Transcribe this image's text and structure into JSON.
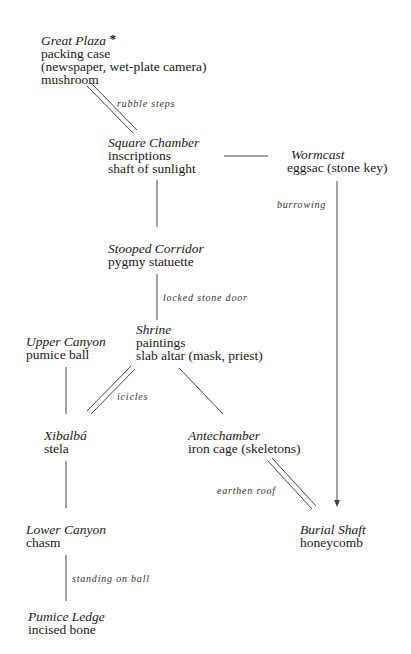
{
  "diagram": {
    "type": "map",
    "nodes": [
      {
        "id": "great-plaza",
        "title": "Great Plaza",
        "marker": "*",
        "items": [
          "packing case",
          "(newspaper, wet-plate camera)",
          "mushroom"
        ]
      },
      {
        "id": "square-chamber",
        "title": "Square Chamber",
        "items": [
          "inscriptions",
          "shaft of sunlight"
        ]
      },
      {
        "id": "wormcast",
        "title": "Wormcast",
        "items": [
          "eggsac (stone key)"
        ]
      },
      {
        "id": "stooped-corridor",
        "title": "Stooped Corridor",
        "items": [
          "pygmy statuette"
        ]
      },
      {
        "id": "shrine",
        "title": "Shrine",
        "items": [
          "paintings",
          "slab altar (mask, priest)"
        ]
      },
      {
        "id": "upper-canyon",
        "title": "Upper Canyon",
        "items": [
          "pumice ball"
        ]
      },
      {
        "id": "xibalba",
        "title": "Xibalbá",
        "items": [
          "stela"
        ]
      },
      {
        "id": "antechamber",
        "title": "Antechamber",
        "items": [
          "iron cage (skeletons)"
        ]
      },
      {
        "id": "lower-canyon",
        "title": "Lower Canyon",
        "items": [
          "chasm"
        ]
      },
      {
        "id": "burial-shaft",
        "title": "Burial Shaft",
        "items": [
          "honeycomb"
        ]
      },
      {
        "id": "pumice-ledge",
        "title": "Pumice Ledge",
        "items": [
          "incised bone"
        ]
      }
    ],
    "edges": [
      {
        "from": "great-plaza",
        "to": "square-chamber",
        "style": "double",
        "label": "rubble steps"
      },
      {
        "from": "square-chamber",
        "to": "wormcast",
        "style": "single",
        "label": ""
      },
      {
        "from": "wormcast",
        "to": "burial-shaft",
        "style": "arrow",
        "label": "burrowing"
      },
      {
        "from": "square-chamber",
        "to": "stooped-corridor",
        "style": "single",
        "label": ""
      },
      {
        "from": "stooped-corridor",
        "to": "shrine",
        "style": "single",
        "label": "locked stone door"
      },
      {
        "from": "shrine",
        "to": "xibalba",
        "style": "double",
        "label": "icicles"
      },
      {
        "from": "shrine",
        "to": "antechamber",
        "style": "single",
        "label": ""
      },
      {
        "from": "upper-canyon",
        "to": "xibalba",
        "style": "single",
        "label": ""
      },
      {
        "from": "antechamber",
        "to": "burial-shaft",
        "style": "double",
        "label": "earthen roof"
      },
      {
        "from": "xibalba",
        "to": "lower-canyon",
        "style": "single",
        "label": ""
      },
      {
        "from": "lower-canyon",
        "to": "pumice-ledge",
        "style": "single",
        "label": "standing on ball"
      }
    ]
  }
}
